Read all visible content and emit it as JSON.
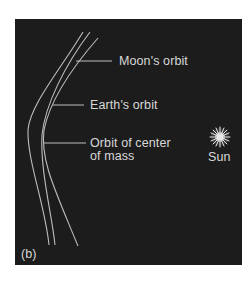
{
  "figure": {
    "panel_label": "(b)",
    "background_color": "#1c1c1c",
    "line_color": "#bdbdbd",
    "text_color": "#d8d8d8"
  },
  "labels": {
    "moon_orbit": "Moon's orbit",
    "earth_orbit": "Earth's orbit",
    "center_of_mass_orbit_line1": "Orbit of center",
    "center_of_mass_orbit_line2": "of mass",
    "sun": "Sun"
  },
  "icons": {
    "sun": "starburst-icon"
  }
}
